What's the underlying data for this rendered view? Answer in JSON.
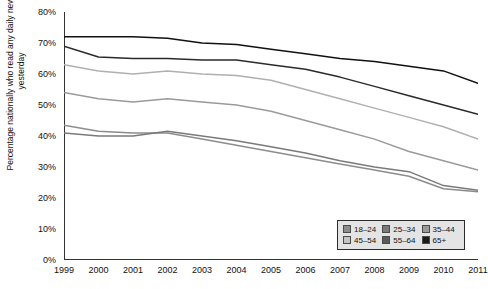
{
  "chart_data": {
    "type": "line",
    "title": "",
    "xlabel": "",
    "ylabel": "Percentage nationally who read any daily newspaper yesterday",
    "x": [
      1999,
      2000,
      2001,
      2002,
      2003,
      2004,
      2005,
      2006,
      2007,
      2008,
      2009,
      2010,
      2011
    ],
    "xtick_labels": [
      "1999",
      "2000",
      "2001",
      "2002",
      "2003",
      "2004",
      "2005",
      "2006",
      "2007",
      "2008",
      "2009",
      "2010",
      "2011"
    ],
    "ylim": [
      0,
      80
    ],
    "ytick_labels": [
      "0%",
      "10%",
      "20%",
      "30%",
      "40%",
      "50%",
      "60%",
      "70%",
      "80%"
    ],
    "ytick_values": [
      0,
      10,
      20,
      30,
      40,
      50,
      60,
      70,
      80
    ],
    "grid": false,
    "legend_position": "bottom-right",
    "series": [
      {
        "name": "18–24",
        "color": "#8c8c8c",
        "swatch": "#8c8c8c",
        "values": [
          43.5,
          41.5,
          41,
          41,
          39,
          37,
          35,
          33,
          31,
          29,
          27,
          23,
          22
        ]
      },
      {
        "name": "25–34",
        "color": "#7a7a7a",
        "swatch": "#7a7a7a",
        "values": [
          41,
          40,
          40,
          41.5,
          40,
          38.5,
          36.5,
          34.5,
          32,
          30,
          28.5,
          24,
          22.5
        ]
      },
      {
        "name": "35–44",
        "color": "#9a9a9a",
        "swatch": "#9a9a9a",
        "values": [
          54,
          52,
          51,
          52,
          51,
          50,
          48,
          45,
          42,
          39,
          35,
          32,
          29
        ]
      },
      {
        "name": "45–54",
        "color": "#b0b0b0",
        "swatch": "#c4c4c4",
        "values": [
          63,
          61,
          60,
          61,
          60,
          59.5,
          58,
          55,
          52,
          49,
          46,
          43,
          39
        ]
      },
      {
        "name": "55–64",
        "color": "#2a2a2a",
        "swatch": "#5a5a5a",
        "values": [
          69,
          65.5,
          65,
          65,
          64.5,
          64.5,
          63,
          61.5,
          59,
          56,
          53,
          50,
          47
        ]
      },
      {
        "name": "65+",
        "color": "#111111",
        "swatch": "#1a1a1a",
        "values": [
          72,
          72,
          72,
          71.5,
          70,
          69.5,
          68,
          66.5,
          65,
          64,
          62.5,
          61,
          57
        ]
      }
    ]
  },
  "legend": {
    "rows": [
      [
        {
          "label": "18–24"
        },
        {
          "label": "25–34"
        },
        {
          "label": "35–44"
        }
      ],
      [
        {
          "label": "45–54"
        },
        {
          "label": "55–64"
        },
        {
          "label": "65+"
        }
      ]
    ]
  }
}
